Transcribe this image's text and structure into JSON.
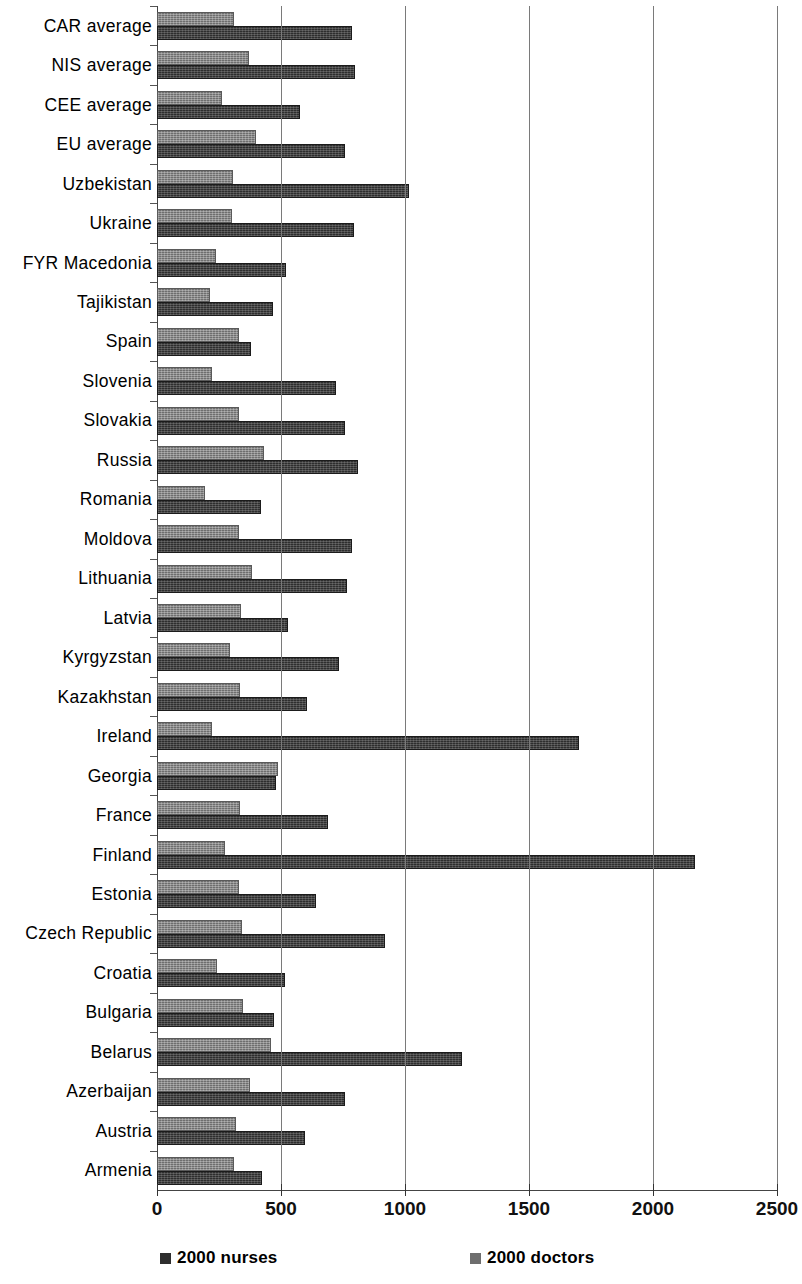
{
  "chart_data": {
    "type": "bar",
    "orientation": "horizontal",
    "title": "",
    "subtitle": "",
    "xlabel": "",
    "ylabel": "",
    "xlim": [
      0,
      2500
    ],
    "xticks": [
      0,
      500,
      1000,
      1500,
      2000,
      2500
    ],
    "xtick_labels": [
      "0",
      "500",
      "1000",
      "1500",
      "2000",
      "2500"
    ],
    "grid": "vertical",
    "legend_position": "bottom",
    "legend": [
      "2000 nurses",
      "2000 doctors"
    ],
    "categories": [
      "CAR average",
      "NIS average",
      "CEE average",
      "EU average",
      "Uzbekistan",
      "Ukraine",
      "FYR Macedonia",
      "Tajikistan",
      "Spain",
      "Slovenia",
      "Slovakia",
      "Russia",
      "Romania",
      "Moldova",
      "Lithuania",
      "Latvia",
      "Kyrgyzstan",
      "Kazakhstan",
      "Ireland",
      "Georgia",
      "France",
      "Finland",
      "Estonia",
      "Czech Republic",
      "Croatia",
      "Bulgaria",
      "Belarus",
      "Azerbaijan",
      "Austria",
      "Armenia"
    ],
    "series": [
      {
        "name": "2000 doctors",
        "color": "#6e6e6e",
        "values": [
          310,
          370,
          262,
          400,
          307,
          303,
          236,
          212,
          331,
          220,
          331,
          433,
          195,
          331,
          385,
          339,
          294,
          335,
          220,
          486,
          335,
          274,
          331,
          343,
          240,
          345,
          460,
          375,
          320,
          310
        ]
      },
      {
        "name": "2000 nurses",
        "color": "#2e2e2e",
        "values": [
          787,
          800,
          576,
          760,
          1018,
          793,
          522,
          466,
          380,
          720,
          760,
          809,
          420,
          788,
          768,
          527,
          732,
          604,
          1700,
          478,
          691,
          2169,
          640,
          920,
          516,
          470,
          1230,
          760,
          595,
          425
        ]
      }
    ]
  },
  "legend": {
    "entries": [
      {
        "label": "2000 nurses",
        "swatch": "nurses-swatch"
      },
      {
        "label": "2000 doctors",
        "swatch": "doctors-swatch"
      }
    ]
  }
}
